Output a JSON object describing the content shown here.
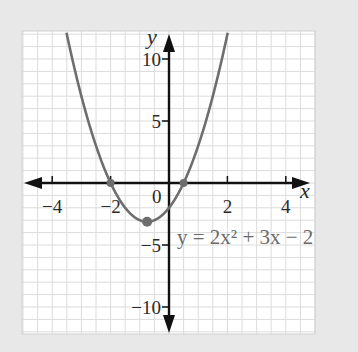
{
  "chart_data": {
    "type": "line",
    "title": "",
    "equation_label": "y = 2x² + 3x − 2",
    "equation": {
      "a": 2,
      "b": 3,
      "c": -2
    },
    "xlabel": "x",
    "ylabel": "y",
    "xlim": [
      -5.1,
      5.0
    ],
    "ylim": [
      -12.3,
      12.1
    ],
    "x_ticks": [
      -4,
      -2,
      2,
      4
    ],
    "x_tick_labels": [
      "−4",
      "−2",
      "2",
      "4"
    ],
    "y_ticks": [
      10,
      5,
      -5,
      -10
    ],
    "y_tick_labels": [
      "10",
      "5",
      "−5",
      "−10"
    ],
    "origin_label": "0",
    "grid": true,
    "grid_x_step": 0.5,
    "grid_y_step": 1,
    "marked_points": [
      {
        "label": "root",
        "x": -2,
        "y": 0
      },
      {
        "label": "root",
        "x": 0.5,
        "y": 0
      },
      {
        "label": "vertex",
        "x": -0.75,
        "y": -3.125
      }
    ],
    "series": [
      {
        "name": "y = 2x² + 3x − 2",
        "color": "#6e6e6e"
      }
    ]
  },
  "colors": {
    "background": "#e8e8e8",
    "grid_bg": "#ffffff",
    "grid_line": "#dcdcdc",
    "axis": "#111111",
    "curve": "#6e6e6e"
  }
}
